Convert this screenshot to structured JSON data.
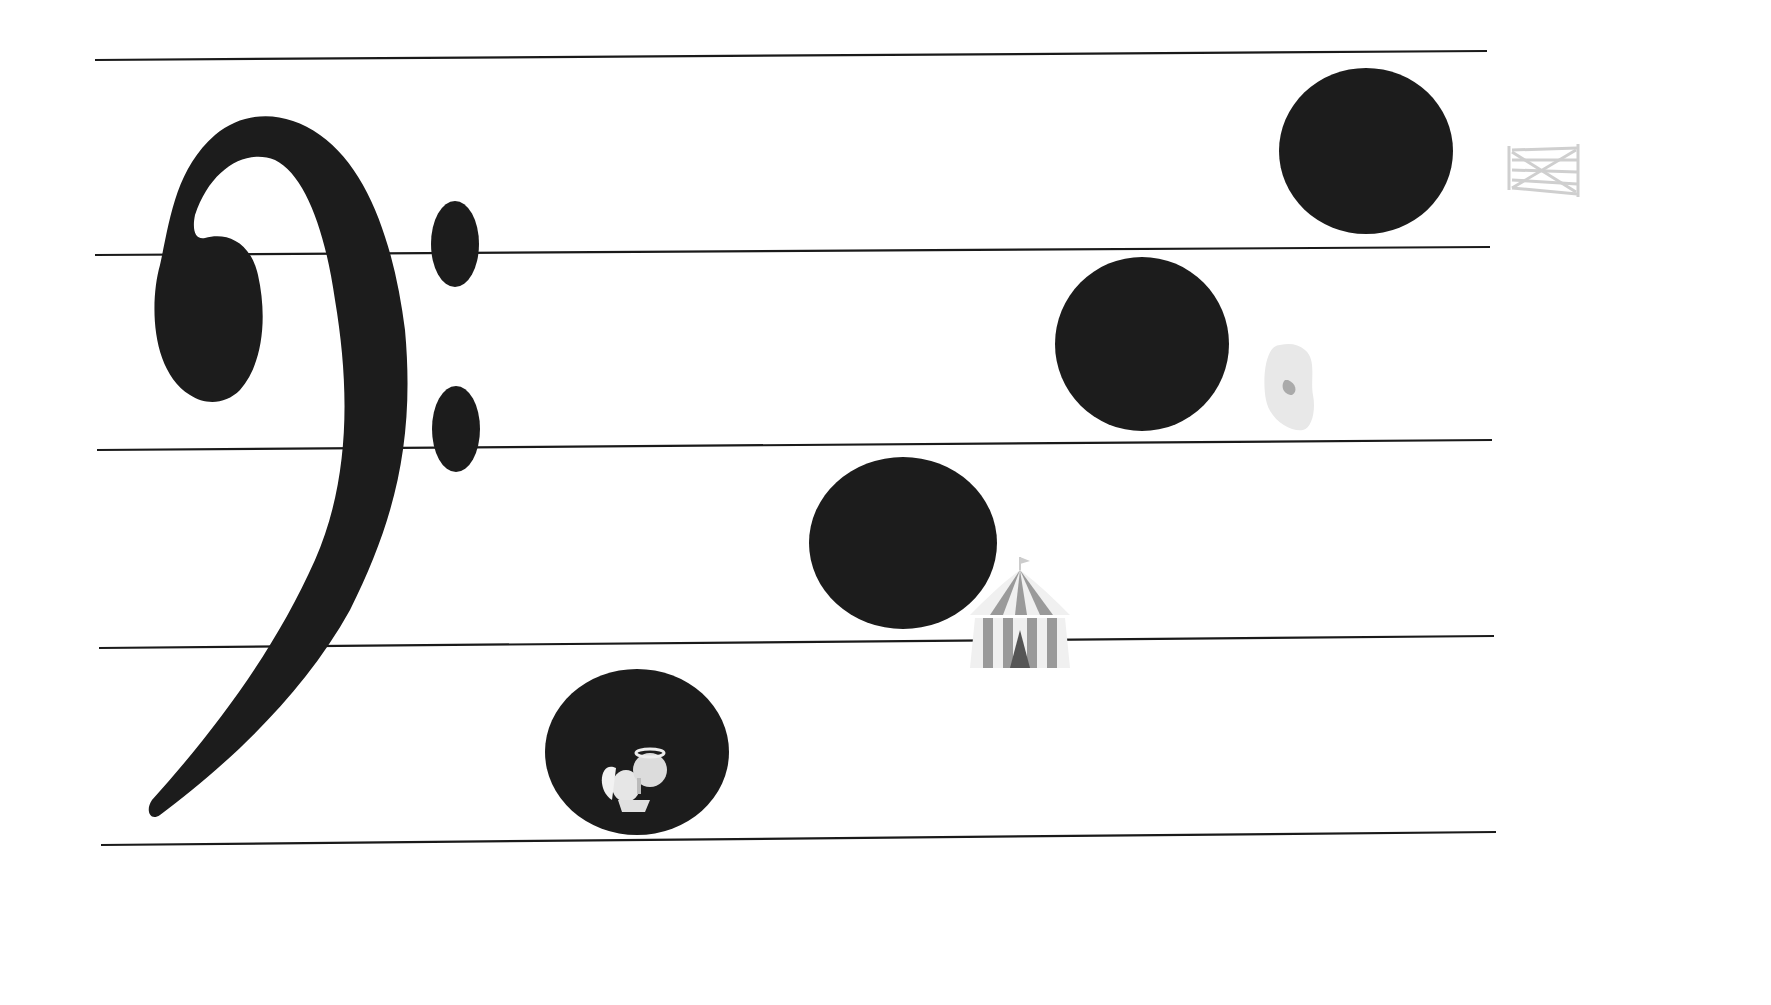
{
  "diagram": {
    "type": "bass-clef-staff-mnemonic",
    "clef": {
      "icon": "bass-clef-icon"
    },
    "staff": {
      "line_color": "#1a1a1a",
      "lines": [
        {
          "x1": 95,
          "y1": 60,
          "x2": 1487,
          "y2": 51
        },
        {
          "x1": 95,
          "y1": 255,
          "x2": 1490,
          "y2": 247
        },
        {
          "x1": 97,
          "y1": 450,
          "x2": 1492,
          "y2": 440
        },
        {
          "x1": 99,
          "y1": 648,
          "x2": 1494,
          "y2": 636
        },
        {
          "x1": 101,
          "y1": 845,
          "x2": 1496,
          "y2": 832
        }
      ]
    },
    "notes": [
      {
        "icon": "angel-icon",
        "label": "angel",
        "cx": 637,
        "cy": 752,
        "rx": 92,
        "ry": 83
      },
      {
        "icon": "circus-tent-icon",
        "label": "circus tent",
        "cx": 903,
        "cy": 543,
        "rx": 94,
        "ry": 86
      },
      {
        "icon": "ear-icon",
        "label": "ear",
        "cx": 1142,
        "cy": 344,
        "rx": 87,
        "ry": 87
      },
      {
        "icon": "gate-icon",
        "label": "gate",
        "cx": 1366,
        "cy": 151,
        "rx": 87,
        "ry": 83
      }
    ],
    "note_fill": "#1c1c1c"
  }
}
